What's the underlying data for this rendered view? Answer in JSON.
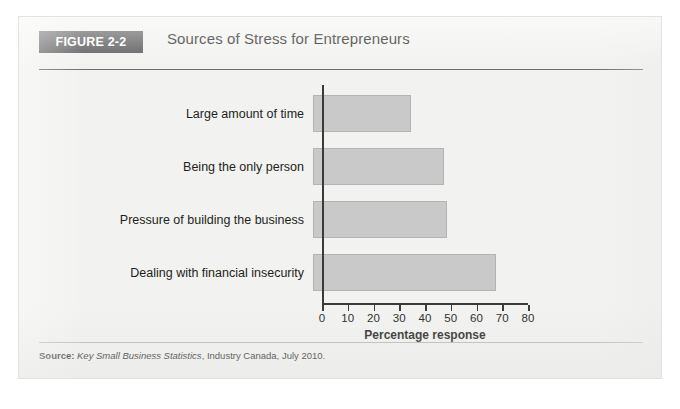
{
  "figure": {
    "badge": "FIGURE 2-2",
    "title": "Sources of Stress for Entrepreneurs",
    "source_lead": "Source:",
    "source_italic": "Key Small Business Statistics",
    "source_rest": ", Industry Canada, July 2010."
  },
  "colors": {
    "badge_bg": "#58585a",
    "badge_text": "#ffffff",
    "bar_fill": "#c9c9c9",
    "bar_border": "#b4b4b4",
    "axis": "#3a3a3a",
    "panel_bg": "#f2f2f0",
    "text": "#231f20"
  },
  "chart_data": {
    "type": "bar",
    "orientation": "horizontal",
    "title": "Sources of Stress for Entrepreneurs",
    "xlabel": "Percentage response",
    "ylabel": "",
    "categories": [
      "Large amount of time",
      "Being the only person",
      "Pressure of building the business",
      "Dealing with financial insecurity"
    ],
    "values": [
      38,
      51,
      52,
      71
    ],
    "xlim": [
      0,
      80
    ],
    "xticks": [
      0,
      10,
      20,
      30,
      40,
      50,
      60,
      70,
      80
    ],
    "xtick_labels": [
      "0",
      "10",
      "20",
      "30",
      "40",
      "50",
      "60",
      "70",
      "80"
    ],
    "grid": false,
    "legend": false
  }
}
